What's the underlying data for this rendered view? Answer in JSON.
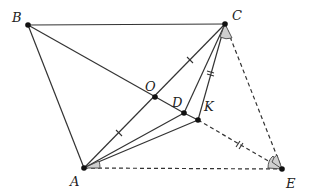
{
  "figure": {
    "points": {
      "A": {
        "label": "A",
        "x": 84,
        "y": 168,
        "lx": 70,
        "ly": 186
      },
      "B": {
        "label": "B",
        "x": 28,
        "y": 25,
        "lx": 12,
        "ly": 22
      },
      "C": {
        "label": "C",
        "x": 225,
        "y": 24,
        "lx": 232,
        "ly": 20
      },
      "O": {
        "label": "O",
        "x": 155,
        "y": 97,
        "lx": 145,
        "ly": 91
      },
      "D": {
        "label": "D",
        "x": 184,
        "y": 113,
        "lx": 172,
        "ly": 107
      },
      "K": {
        "label": "K",
        "x": 198,
        "y": 120,
        "lx": 204,
        "ly": 111
      },
      "E": {
        "label": "E",
        "x": 282,
        "y": 169,
        "lx": 286,
        "ly": 188
      }
    },
    "solid_segments": [
      "BC",
      "BA",
      "BD",
      "AC",
      "AD",
      "AK",
      "CD",
      "CK"
    ],
    "dashed_segments": [
      "CE",
      "KE",
      "AE"
    ],
    "equal_marks": {
      "single": [
        "AO",
        "OC"
      ],
      "double": [
        "CK",
        "KE"
      ]
    },
    "angle_marks": [
      "angle-ACK at C",
      "angle-KAE at A",
      "angle-CEK at E"
    ]
  }
}
